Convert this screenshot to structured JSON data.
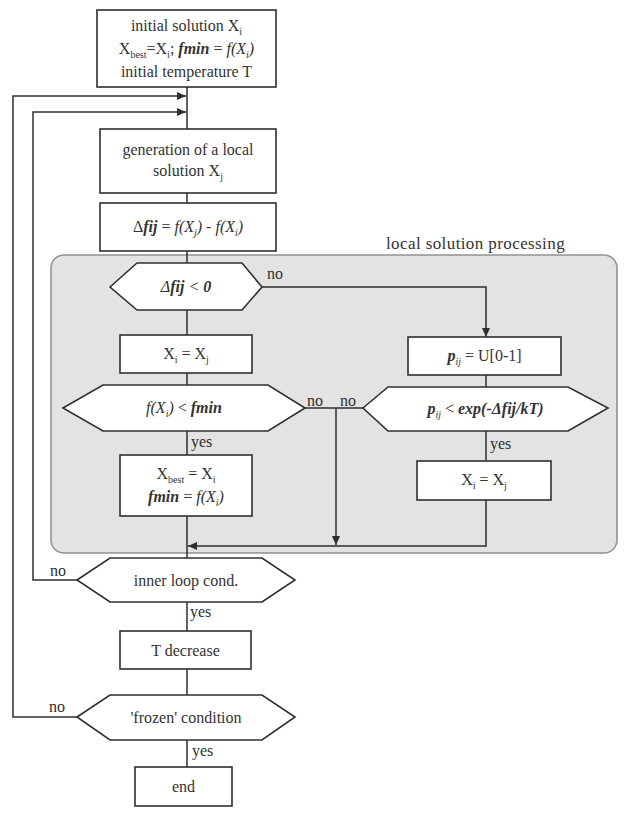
{
  "colors": {
    "panel_fill": "#e3e3e3",
    "panel_stroke": "#939393",
    "line": "#2f2f2f",
    "node_fill": "#ffffff",
    "text": "#333333"
  },
  "group_label": "local solution processing",
  "nodes": {
    "start": {
      "shape": "rect",
      "lines": [
        [
          "initial solution X",
          "i"
        ],
        [
          "X",
          "best",
          "=X",
          "i",
          "; ",
          "fmin",
          " = ",
          "f(X",
          "i",
          ")"
        ],
        [
          "initial temperature T"
        ]
      ]
    },
    "generate": {
      "shape": "rect",
      "lines": [
        [
          "generation of a local"
        ],
        [
          "solution X",
          "j"
        ]
      ]
    },
    "delta": {
      "shape": "rect",
      "lines": [
        [
          "Δ",
          "fij",
          " = ",
          "f(X",
          "j",
          ")",
          " - ",
          "f(X",
          "i",
          ")"
        ]
      ]
    },
    "cond_delta": {
      "shape": "hexagon",
      "lines": [
        [
          "Δ",
          "fij",
          " < ",
          "0"
        ]
      ]
    },
    "accept_left": {
      "shape": "rect",
      "lines": [
        [
          "X",
          "i",
          " = X",
          "j"
        ]
      ]
    },
    "cond_fmin": {
      "shape": "hexagon",
      "lines": [
        [
          "f(X",
          "i",
          ")",
          " < ",
          "fmin"
        ]
      ]
    },
    "update_best": {
      "shape": "rect",
      "lines": [
        [
          "X",
          "best",
          " = X",
          "i"
        ],
        [
          "fmin",
          " = ",
          "f(X",
          "i",
          ")"
        ]
      ]
    },
    "random_p": {
      "shape": "rect",
      "lines": [
        [
          "p",
          "ij",
          " = ",
          "U[0-1]"
        ]
      ]
    },
    "cond_metropolis": {
      "shape": "hexagon",
      "lines": [
        [
          "p",
          "ij",
          " < ",
          "exp(-Δfij/kT)"
        ]
      ]
    },
    "accept_right": {
      "shape": "rect",
      "lines": [
        [
          "X",
          "i",
          " = X",
          "j"
        ]
      ]
    },
    "cond_inner": {
      "shape": "hexagon",
      "lines": [
        [
          "inner loop cond."
        ]
      ]
    },
    "t_decrease": {
      "shape": "rect",
      "lines": [
        [
          "T decrease"
        ]
      ]
    },
    "cond_frozen": {
      "shape": "hexagon",
      "lines": [
        [
          "'frozen' condition"
        ]
      ]
    },
    "end": {
      "shape": "rect",
      "lines": [
        [
          "end"
        ]
      ]
    }
  },
  "edge_labels": {
    "delta_no": "no",
    "fmin_no": "no",
    "metropolis_no": "no",
    "fmin_yes": "yes",
    "metropolis_yes": "yes",
    "inner_no": "no",
    "inner_yes": "yes",
    "frozen_no": "no",
    "frozen_yes": "yes"
  }
}
